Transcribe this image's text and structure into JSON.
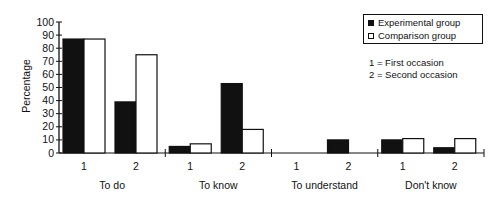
{
  "chart_data": {
    "type": "bar",
    "title": "",
    "xlabel": "",
    "ylabel": "Percentage",
    "ylim": [
      0,
      100
    ],
    "yticks": [
      0,
      10,
      20,
      30,
      40,
      50,
      60,
      70,
      80,
      90,
      100
    ],
    "grid": false,
    "legend_position": "top-right",
    "groups": [
      "To do",
      "To know",
      "To understand",
      "Don't know"
    ],
    "categories": [
      "1",
      "2",
      "1",
      "2",
      "1",
      "2",
      "1",
      "2"
    ],
    "series": [
      {
        "name": "Experimental group",
        "color": "#111111",
        "values": [
          87,
          39,
          5,
          53,
          0,
          10,
          10,
          4
        ]
      },
      {
        "name": "Comparison group",
        "color": "#ffffff",
        "values": [
          87,
          75,
          7,
          18,
          0,
          0,
          11,
          11
        ]
      }
    ],
    "annotations": [
      "1 = First occasion",
      "2 = Second occasion"
    ]
  },
  "legend": {
    "items": [
      {
        "label": "Experimental group",
        "swatch": "black"
      },
      {
        "label": "Comparison group",
        "swatch": "white"
      }
    ]
  },
  "notes": {
    "first": "1 = First occasion",
    "second": "2 = Second occasion"
  },
  "axis": {
    "ylabel": "Percentage"
  }
}
